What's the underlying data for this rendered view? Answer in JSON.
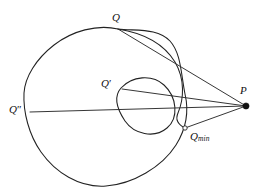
{
  "figure": {
    "type": "geometric-diagram",
    "background_color": "#ffffff",
    "stroke_color": "#222222"
  },
  "labels": {
    "q": {
      "text": "Q",
      "x": 112,
      "y": 12
    },
    "q_prime": {
      "text": "Q",
      "prime": "′",
      "x": 101,
      "y": 78
    },
    "q_double_prime": {
      "text": "Q",
      "prime": "″",
      "x": 9,
      "y": 104
    },
    "q_min_base": {
      "text": "Q",
      "sub": "min",
      "x": 190,
      "y": 131
    },
    "p": {
      "text": "P",
      "x": 240,
      "y": 85
    }
  },
  "points": {
    "Q": {
      "x": 118,
      "y": 29,
      "marker": "none"
    },
    "Qp": {
      "x": 122,
      "y": 89,
      "marker": "none"
    },
    "Qpp": {
      "x": 30,
      "y": 112,
      "marker": "none"
    },
    "Qmin": {
      "x": 185,
      "y": 128,
      "marker": "open-circle",
      "radius": 2.2
    },
    "P": {
      "x": 246,
      "y": 106,
      "marker": "filled-dot",
      "radius": 3.1
    }
  },
  "rays": [
    {
      "name": "ray-P-Q",
      "from": "P",
      "to": "Q"
    },
    {
      "name": "ray-P-Qp",
      "from": "P",
      "to": "Qp"
    },
    {
      "name": "ray-P-Qpp",
      "from": "P",
      "to": "Qpp"
    },
    {
      "name": "ray-P-Qmin",
      "from": "P",
      "to": "Qmin"
    }
  ],
  "paths": {
    "outer_curve": "M 118 29 C 96 24 70 32 52 46 C 34 60 24 78 24 94 C 24 112 29 134 40 150 C 53 170 78 187 105 186 C 132 185 163 168 177 146 C 187 130 189 112 185 95 C 181 76 180 55 170 42 C 158 27 139 31 118 29 Z",
    "inner_loop": "M 122 89 C 136 76 156 76 167 88 C 178 100 178 119 166 128 C 153 138 134 134 125 122 C 116 110 114 97 122 89 Z",
    "outer_right_tail": "M 118 29 C 142 32 163 42 174 60 C 184 77 184 98 178 113 C 173 125 183 127 185 128"
  }
}
